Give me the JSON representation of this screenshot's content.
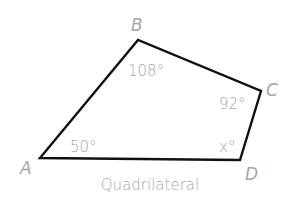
{
  "diagram": {
    "caption": "Quadrilateral",
    "stroke_color": "#111111",
    "label_color": "#a6a6a6",
    "vertices": {
      "A": {
        "label": "A",
        "x": 40,
        "y": 158
      },
      "B": {
        "label": "B",
        "x": 138,
        "y": 40
      },
      "C": {
        "label": "C",
        "x": 261,
        "y": 91
      },
      "D": {
        "label": "D",
        "x": 240,
        "y": 160
      }
    },
    "angles": {
      "A": "50°",
      "B": "108°",
      "C": "92°",
      "D": "x°"
    }
  }
}
